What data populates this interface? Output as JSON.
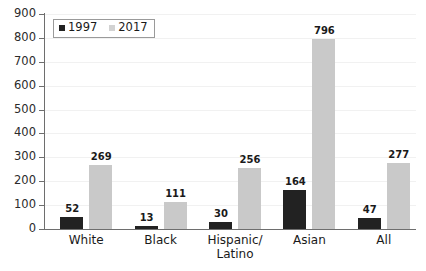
{
  "chart_data": {
    "type": "bar",
    "title": "",
    "subtitle": "",
    "xlabel": "",
    "ylabel": "",
    "ylim": [
      0,
      900
    ],
    "ytick_step": 100,
    "yticks": [
      "900",
      "800",
      "700",
      "600",
      "500",
      "400",
      "300",
      "200",
      "100",
      "0"
    ],
    "grid": true,
    "grid_axis": "y",
    "legend_position": "top-left",
    "categories": [
      "White",
      "Black",
      "Hispanic/ Latino",
      "Asian",
      "All"
    ],
    "category_lines": [
      [
        "White",
        ""
      ],
      [
        "Black",
        ""
      ],
      [
        "Hispanic/",
        "Latino"
      ],
      [
        "Asian",
        ""
      ],
      [
        "All",
        ""
      ]
    ],
    "series": [
      {
        "name": "1997",
        "color": "#222222",
        "values": [
          52,
          13,
          30,
          164,
          47
        ],
        "labels": [
          "52",
          "13",
          "30",
          "164",
          "47"
        ]
      },
      {
        "name": "2017",
        "color": "#c9c9c9",
        "values": [
          269,
          111,
          256,
          796,
          277
        ],
        "labels": [
          "269",
          "111",
          "256",
          "796",
          "277"
        ]
      }
    ]
  },
  "legend": {
    "items": [
      {
        "label": "1997",
        "color": "#222222"
      },
      {
        "label": "2017",
        "color": "#d2d2d2"
      }
    ]
  },
  "axis": {
    "y_labels": [
      "900",
      "800",
      "700",
      "600",
      "500",
      "400",
      "300",
      "200",
      "100",
      "0"
    ],
    "axis_color": "#6e6e6e",
    "grid_color": "#f1f1f1"
  }
}
